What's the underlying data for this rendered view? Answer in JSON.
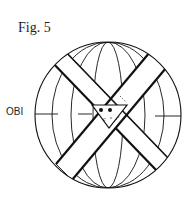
{
  "figure": {
    "title": "Fig. 5",
    "labels": {
      "obi": "OBI",
      "c1": "c",
      "c2": "c"
    },
    "colors": {
      "line": "#111111",
      "background": "#ffffff"
    }
  }
}
